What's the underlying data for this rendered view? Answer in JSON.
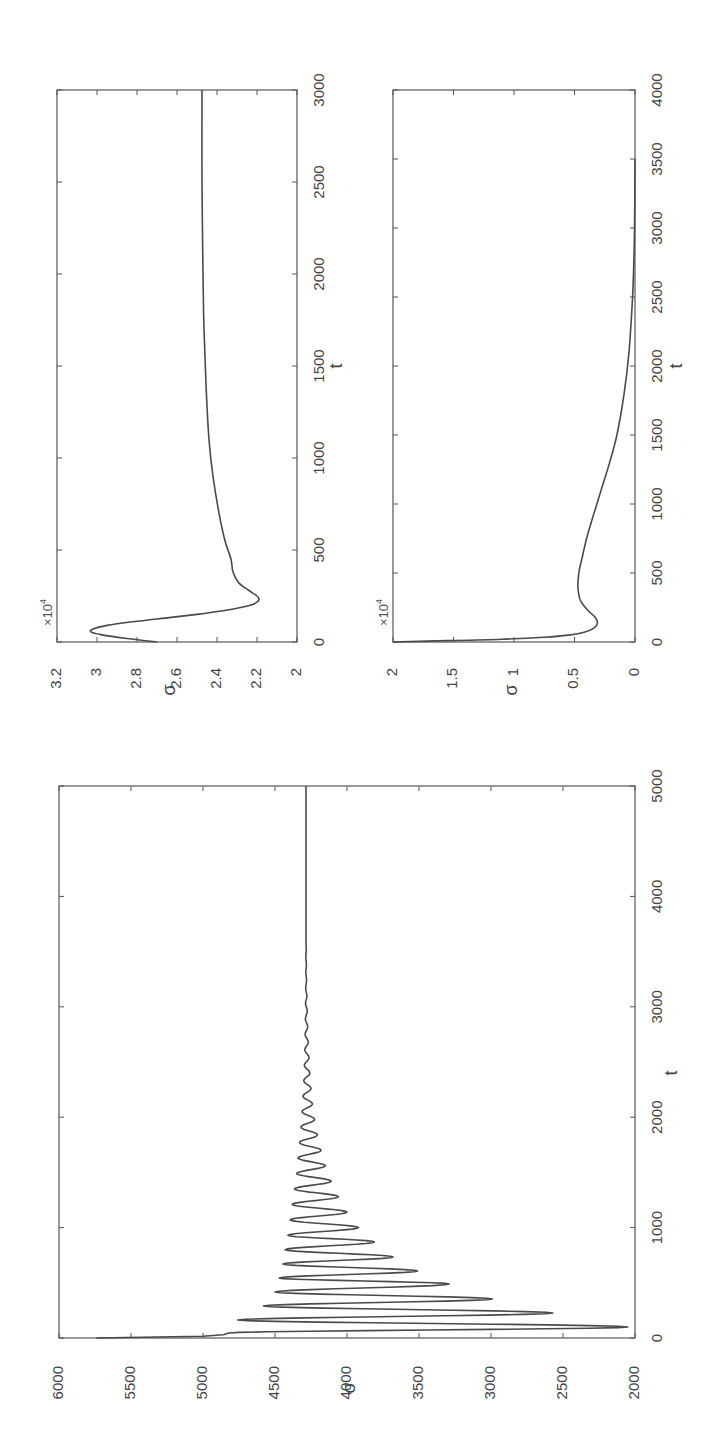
{
  "figure": {
    "orientation_note": "rotated 90 degrees counter-clockwise",
    "background": "#ffffff",
    "line_color": "#4a4a4a"
  },
  "chart_data": [
    {
      "id": "plot-a",
      "type": "line",
      "title": "",
      "xlabel": "t",
      "ylabel": "σ",
      "y_multiplier_label": "×10^4",
      "xlim": [
        0,
        3000
      ],
      "ylim": [
        2,
        3.2
      ],
      "x_ticks": [
        0,
        500,
        1000,
        1500,
        2000,
        2500,
        3000
      ],
      "x_tick_labels": [
        "0",
        "500",
        "1000",
        "1500",
        "2000",
        "2500",
        "3000"
      ],
      "y_ticks": [
        2,
        2.2,
        2.4,
        2.6,
        2.8,
        3,
        3.2
      ],
      "y_tick_labels": [
        "2",
        "2.2",
        "2.4",
        "2.6",
        "2.8",
        "3",
        "3.2"
      ],
      "grid": false,
      "series": [
        {
          "name": "sigma",
          "x": [
            0,
            20,
            40,
            55,
            70,
            90,
            110,
            130,
            150,
            170,
            190,
            210,
            230,
            250,
            280,
            320,
            380,
            450,
            550,
            700,
            900,
            1100,
            1400,
            1700,
            2000,
            2500,
            3000
          ],
          "values": [
            2.7,
            2.86,
            2.98,
            3.03,
            3.02,
            2.95,
            2.82,
            2.66,
            2.5,
            2.37,
            2.27,
            2.21,
            2.19,
            2.2,
            2.24,
            2.29,
            2.32,
            2.33,
            2.36,
            2.39,
            2.42,
            2.44,
            2.455,
            2.465,
            2.47,
            2.475,
            2.475
          ]
        }
      ]
    },
    {
      "id": "plot-b",
      "type": "line",
      "title": "",
      "xlabel": "t",
      "ylabel": "σ",
      "y_multiplier_label": "×10^4",
      "xlim": [
        0,
        4000
      ],
      "ylim": [
        0,
        2
      ],
      "x_ticks": [
        0,
        500,
        1000,
        1500,
        2000,
        2500,
        3000,
        3500,
        4000
      ],
      "x_tick_labels": [
        "0",
        "500",
        "1000",
        "1500",
        "2000",
        "2500",
        "3000",
        "3500",
        "4000"
      ],
      "y_ticks": [
        0,
        0.5,
        1,
        1.5,
        2
      ],
      "y_tick_labels": [
        "0",
        "0.5",
        "1",
        "1.5",
        "2"
      ],
      "grid": false,
      "series": [
        {
          "name": "sigma",
          "x": [
            0,
            10,
            20,
            35,
            50,
            70,
            100,
            138,
            180,
            230,
            300,
            380,
            450,
            520,
            600,
            750,
            900,
            1100,
            1300,
            1500,
            1800,
            2100,
            2500,
            2800,
            3000,
            3300,
            3500
          ],
          "values": [
            2.0,
            1.55,
            1.1,
            0.75,
            0.55,
            0.42,
            0.34,
            0.31,
            0.33,
            0.39,
            0.45,
            0.47,
            0.47,
            0.46,
            0.44,
            0.4,
            0.35,
            0.28,
            0.21,
            0.15,
            0.09,
            0.05,
            0.02,
            0.008,
            0.004,
            0.001,
            0.0
          ]
        }
      ]
    },
    {
      "id": "plot-c",
      "type": "line",
      "title": "",
      "xlabel": "t",
      "ylabel": "σ",
      "xlim": [
        0,
        5000
      ],
      "ylim": [
        2000,
        6000
      ],
      "x_ticks": [
        0,
        1000,
        2000,
        3000,
        4000,
        5000
      ],
      "x_tick_labels": [
        "0",
        "1000",
        "2000",
        "3000",
        "4000",
        "5000"
      ],
      "y_ticks": [
        2000,
        2500,
        3000,
        3500,
        4000,
        4500,
        5000,
        5500,
        6000
      ],
      "y_tick_labels": [
        "2000",
        "2500",
        "3000",
        "3500",
        "4000",
        "4500",
        "5000",
        "5500",
        "6000"
      ],
      "grid": false,
      "series": [
        {
          "name": "sigma",
          "initial_segment": {
            "x": [
              0,
              15,
              30,
              45
            ],
            "values": [
              5740,
              5000,
              4860,
              4820
            ]
          },
          "extrema": {
            "t": [
              100,
              163,
              226,
              290,
              353,
              417,
              489,
              543,
              607,
              670,
              734,
              800,
              870,
              930,
              1000,
              1070,
              1140,
              1210,
              1280,
              1350,
              1420,
              1490,
              1560,
              1630,
              1700,
              1770,
              1840,
              1910,
              1980,
              2050,
              2120,
              2190,
              2260,
              2330,
              2400,
              2470,
              2540,
              2610,
              2680,
              2750,
              2820,
              2890,
              2960,
              3030,
              3100,
              3170,
              3240,
              3310,
              3380,
              3450,
              3520,
              3590
            ],
            "values": [
              2050,
              4760,
              2570,
              4580,
              2990,
              4500,
              3290,
              4470,
              3510,
              4445,
              3680,
              4430,
              3810,
              4410,
              3920,
              4395,
              4000,
              4380,
              4060,
              4365,
              4110,
              4350,
              4150,
              4340,
              4180,
              4330,
              4205,
              4320,
              4225,
              4312,
              4240,
              4305,
              4250,
              4300,
              4258,
              4296,
              4264,
              4293,
              4269,
              4291,
              4273,
              4289,
              4276,
              4288,
              4279,
              4287,
              4281,
              4286,
              4282,
              4286,
              4283,
              4285
            ]
          },
          "steady_state": {
            "from_t": 3650,
            "to_t": 5000,
            "value": 4285
          }
        }
      ]
    }
  ],
  "labels": {
    "plot_a": {
      "xlabel": "t",
      "ylabel": "σ",
      "multiplier": "×10",
      "multiplier_exp": "4"
    },
    "plot_b": {
      "xlabel": "t",
      "ylabel": "σ",
      "multiplier": "×10",
      "multiplier_exp": "4"
    },
    "plot_c": {
      "xlabel": "t",
      "ylabel": "σ"
    }
  }
}
